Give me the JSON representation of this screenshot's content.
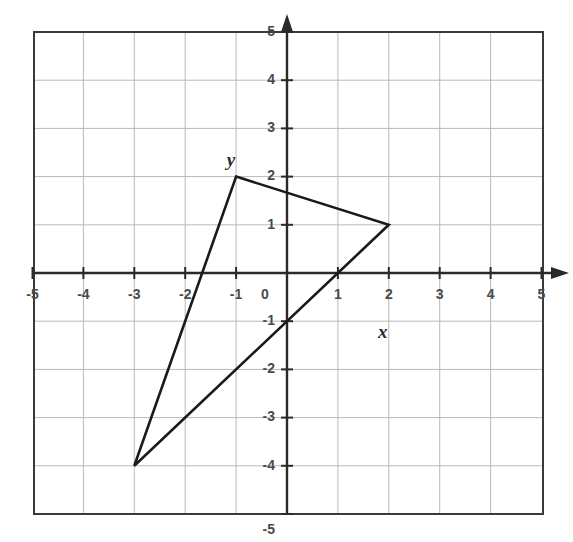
{
  "figure": {
    "kind": "cartesian-coordinate-plane",
    "background_color": "#ffffff"
  },
  "chart_data": {
    "type": "scatter",
    "title": "",
    "xlabel": "x",
    "ylabel": "y",
    "xlim": [
      -5,
      5
    ],
    "ylim": [
      -5,
      5
    ],
    "grid": true,
    "grid_step": 1,
    "legend": "none",
    "x_tick_labels": [
      "-5",
      "-4",
      "-3",
      "-2",
      "-1",
      "0",
      "1",
      "2",
      "3",
      "4",
      "5"
    ],
    "x_tick_values": [
      -5,
      -4,
      -3,
      -2,
      -1,
      0,
      1,
      2,
      3,
      4,
      5
    ],
    "y_tick_labels": [
      "-5",
      "-4",
      "-3",
      "-2",
      "-1",
      "1",
      "2",
      "3",
      "4",
      "5"
    ],
    "y_tick_values": [
      -5,
      -4,
      -3,
      -2,
      -1,
      1,
      2,
      3,
      4,
      5
    ],
    "origin_label": "0",
    "series": [
      {
        "name": "triangle",
        "shape": "closed-polygon",
        "stroke_color": "#1a1a1a",
        "stroke_width": 2.6,
        "fill": "none",
        "vertices": [
          {
            "label": "A",
            "x": -1,
            "y": 2
          },
          {
            "label": "B",
            "x": 2,
            "y": 1
          },
          {
            "label": "C",
            "x": -3,
            "y": -4
          }
        ],
        "edge_crossings": [
          {
            "x": 1,
            "y": 0
          },
          {
            "x": 0,
            "y": -1
          }
        ]
      }
    ],
    "annotations": [
      {
        "text": "y",
        "x": -1.1,
        "y": 2.3,
        "style": "italic",
        "role": "y-axis-name"
      },
      {
        "text": "x",
        "x": 1.88,
        "y": -1.25,
        "style": "italic",
        "role": "x-axis-name"
      }
    ],
    "colors": {
      "grid_line": "#b9b9b9",
      "border": "#3a3a3a",
      "axis": "#2a2a2a",
      "polygon": "#1a1a1a",
      "tick_text": "#4a4a4a"
    }
  },
  "geometry": {
    "plot_left_px": 34,
    "plot_top_px": 32,
    "plot_right_px": 543,
    "plot_bottom_px": 514,
    "origin_x_px": 287,
    "origin_y_px": 273,
    "unit_x_px": 50.9,
    "unit_y_px": 48.2
  }
}
